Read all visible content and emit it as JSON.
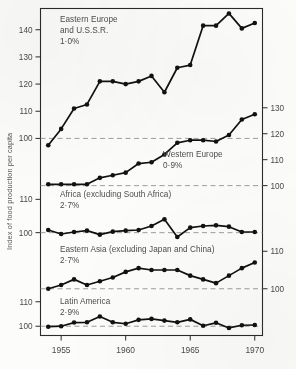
{
  "chart_data": {
    "type": "line",
    "title": "",
    "xlabel": "",
    "ylabel": "Index of food production per capita",
    "x": [
      1954,
      1955,
      1956,
      1957,
      1958,
      1959,
      1960,
      1961,
      1962,
      1963,
      1964,
      1965,
      1966,
      1967,
      1968,
      1969,
      1970
    ],
    "xlim": [
      1953.4,
      1970.6
    ],
    "xticks": [
      1955,
      1960,
      1965,
      1970
    ],
    "xtick_labels": [
      "1955",
      "1960",
      "1965",
      "1970"
    ],
    "grid": false,
    "legend_position": "inline-annotations",
    "baseline_note": "Each panel has a dashed reference line at index 100",
    "panels": [
      {
        "name": "Eastern Europe and U.S.S.R.",
        "label_line1": "Eastern Europe",
        "label_line2": "and U.S.S.R.",
        "growth_rate": "1·0%",
        "axis": "left",
        "ylim": [
          95,
          148
        ],
        "yticks": [
          100,
          110,
          120,
          130,
          140
        ],
        "ytick_labels": [
          "100",
          "110",
          "120",
          "130",
          "140"
        ],
        "baseline": 100,
        "values": [
          97.5,
          103.5,
          111.0,
          112.5,
          121.0,
          121.0,
          120.0,
          121.0,
          123.0,
          117.0,
          126.0,
          127.0,
          141.5,
          141.5,
          146.0,
          140.5,
          142.5
        ]
      },
      {
        "name": "Western Europe",
        "label_line1": "Western Europe",
        "label_line2": "",
        "growth_rate": "0·9%",
        "axis": "right",
        "ylim": [
          96,
          133
        ],
        "yticks": [
          100,
          110,
          120,
          130
        ],
        "ytick_labels": [
          "100",
          "110",
          "120",
          "130"
        ],
        "baseline": 100,
        "values": [
          100.5,
          100.5,
          100.5,
          100.5,
          103.0,
          104.0,
          105.0,
          108.5,
          109.0,
          112.0,
          116.5,
          117.5,
          117.5,
          117.0,
          119.5,
          125.5,
          127.5
        ]
      },
      {
        "name": "Africa (excluding South Africa)",
        "label_line1": "Africa (excluding South Africa)",
        "label_line2": "",
        "growth_rate": "2·7%",
        "axis": "left",
        "ylim": [
          96,
          114
        ],
        "yticks": [
          100,
          110
        ],
        "ytick_labels": [
          "100",
          "110"
        ],
        "baseline": 100,
        "values": [
          100.8,
          99.6,
          100.2,
          100.6,
          99.4,
          100.3,
          100.6,
          100.8,
          102.0,
          104.0,
          98.7,
          101.5,
          102.0,
          102.2,
          101.8,
          100.2,
          100.2
        ]
      },
      {
        "name": "Eastern Asia (excluding Japan and China)",
        "label_line1": "Eastern Asia (excluding Japan and China)",
        "label_line2": "",
        "growth_rate": "2·7%",
        "axis": "right",
        "ylim": [
          97,
          113
        ],
        "yticks": [
          100,
          110
        ],
        "ytick_labels": [
          "100",
          "110"
        ],
        "baseline": 100,
        "values": [
          100.0,
          101.0,
          102.5,
          101.0,
          102.0,
          103.0,
          104.5,
          105.5,
          105.0,
          105.0,
          105.0,
          103.5,
          102.5,
          101.5,
          103.5,
          105.5,
          107.0
        ]
      },
      {
        "name": "Latin America",
        "label_line1": "Latin America",
        "label_line2": "",
        "growth_rate": "2·9%",
        "axis": "left",
        "ylim": [
          96,
          114
        ],
        "yticks": [
          100,
          110
        ],
        "ytick_labels": [
          "100",
          "110"
        ],
        "baseline": 100,
        "values": [
          99.8,
          100.0,
          101.5,
          101.6,
          104.0,
          101.6,
          101.0,
          102.6,
          103.0,
          102.3,
          101.6,
          102.8,
          100.2,
          101.4,
          99.3,
          100.4,
          100.5
        ]
      }
    ]
  },
  "axis": {
    "left_title": "Index of food production per capita"
  }
}
